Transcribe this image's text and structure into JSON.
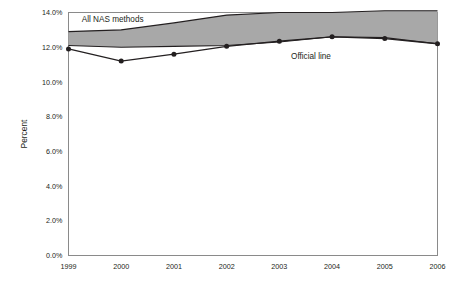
{
  "chart_data": {
    "type": "area",
    "title": "",
    "subtitle": "",
    "xlabel": "",
    "ylabel": "Percent",
    "x": [
      1999,
      2000,
      2001,
      2002,
      2003,
      2004,
      2005,
      2006
    ],
    "categories": [
      "1999",
      "2000",
      "2001",
      "2002",
      "2003",
      "2004",
      "2005",
      "2006"
    ],
    "xlim": [
      1999,
      2006
    ],
    "ylim": [
      0.0,
      14.0
    ],
    "y_ticks": [
      0.0,
      2.0,
      4.0,
      6.0,
      8.0,
      10.0,
      12.0,
      14.0
    ],
    "y_tick_labels": [
      "0.0%",
      "2.0%",
      "4.0%",
      "6.0%",
      "8.0%",
      "10.0%",
      "12.0%",
      "14.0%"
    ],
    "x_tick_labels": [
      "1999",
      "2000",
      "2001",
      "2002",
      "2003",
      "2004",
      "2005",
      "2006"
    ],
    "grid": false,
    "legend_position": "inline-annotation",
    "series": [
      {
        "name": "All NAS methods",
        "role": "band-upper",
        "values": [
          12.9,
          13.0,
          13.4,
          13.85,
          14.0,
          14.0,
          14.1,
          14.1
        ]
      },
      {
        "name": "All NAS methods",
        "role": "band-lower",
        "values": [
          12.1,
          12.0,
          12.05,
          12.1,
          12.3,
          12.6,
          12.55,
          12.2
        ]
      },
      {
        "name": "Official line",
        "role": "line",
        "markers": true,
        "values": [
          11.9,
          11.2,
          11.6,
          12.05,
          12.35,
          12.6,
          12.5,
          12.2
        ]
      }
    ],
    "annotations": [
      {
        "text": "All NAS methods",
        "x": 1999.25,
        "y": 13.45,
        "anchor": "start"
      },
      {
        "text": "Official line",
        "x": 2003.6,
        "y": 11.3,
        "anchor": "middle"
      }
    ],
    "colors": {
      "band_fill": "#a8a8a8",
      "band_edge": "#231f20",
      "line": "#231f20",
      "marker": "#231f20",
      "frame": "#8a8a8a",
      "text": "#231f20",
      "background": "#ffffff"
    }
  }
}
